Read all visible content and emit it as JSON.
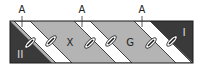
{
  "diagram": {
    "top_labels": [
      {
        "text": "A",
        "x": 22
      },
      {
        "text": "A",
        "x": 82
      },
      {
        "text": "A",
        "x": 142
      }
    ],
    "region_labels": [
      {
        "text": "II",
        "region": "left-dark"
      },
      {
        "text": "X",
        "region": "gray-band-1"
      },
      {
        "text": "G",
        "region": "gray-band-2"
      },
      {
        "text": "I",
        "region": "right-dark"
      }
    ],
    "colors": {
      "dark": "#3a3a3a",
      "gray": "#b4b4b4",
      "white": "#ffffff",
      "stroke": "#1a1a1a"
    }
  }
}
